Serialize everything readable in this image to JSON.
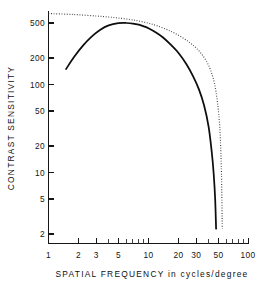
{
  "chart_data": {
    "type": "line",
    "title": "",
    "xlabel": "SPATIAL FREQUENCY  in  cycles/degree",
    "ylabel": "CONTRAST SENSITIVITY",
    "xscale": "log",
    "yscale": "log",
    "xlim": [
      1,
      100
    ],
    "ylim": [
      2,
      700
    ],
    "grid": false,
    "legend": false,
    "xticks": [
      1,
      2,
      3,
      5,
      10,
      20,
      30,
      50,
      100
    ],
    "xticklabels": [
      "1",
      "2",
      "3",
      "5",
      "10",
      "20",
      "30",
      "50",
      "100"
    ],
    "yticks": [
      2,
      5,
      10,
      20,
      50,
      100,
      200,
      500
    ],
    "yticklabels": [
      "2",
      "5",
      "10",
      "20",
      "50",
      "100",
      "200",
      "500"
    ],
    "series": [
      {
        "name": "solid-curve",
        "style": "solid",
        "color": "#0d0d0d",
        "x": [
          1.5,
          1.8,
          2.2,
          2.7,
          3.3,
          4.0,
          5.0,
          6.0,
          7.0,
          8.0,
          9.0,
          10.0,
          12.0,
          14.0,
          17.0,
          20.0,
          24.0,
          28.0,
          32.0,
          36.0,
          40.0,
          43.0,
          45.0,
          46.5,
          47.5
        ],
        "y": [
          150,
          205,
          275,
          350,
          420,
          470,
          497,
          500,
          493,
          478,
          458,
          436,
          388,
          342,
          278,
          228,
          170,
          124,
          88,
          58,
          33,
          17,
          9.5,
          5.0,
          2.3
        ]
      },
      {
        "name": "dotted-curve",
        "style": "dotted",
        "color": "#3c3c3c",
        "x": [
          1.0,
          1.5,
          2.0,
          3.0,
          4.0,
          5.0,
          6.5,
          8.0,
          10.0,
          12.0,
          15.0,
          18.0,
          22.0,
          26.0,
          30.0,
          34.0,
          38.0,
          42.0,
          46.0,
          49.0,
          51.5,
          53.0,
          54.0,
          54.8
        ],
        "y": [
          640,
          630,
          620,
          600,
          585,
          570,
          548,
          527,
          497,
          468,
          425,
          387,
          340,
          298,
          260,
          222,
          184,
          144,
          100,
          63,
          35,
          17,
          7.5,
          2.3
        ]
      }
    ]
  },
  "axis_titles": {
    "x": "SPATIAL  FREQUENCY   in   cycles/degree",
    "y": "CONTRAST  SENSITIVITY"
  }
}
